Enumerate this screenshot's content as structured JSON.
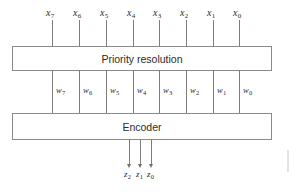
{
  "diagram": {
    "background_color": "#ffffff",
    "line_color": "#7d7d7d",
    "text_color": "#2b2b2b"
  },
  "blocks": [
    {
      "id": "priority",
      "label": "Priority resolution"
    },
    {
      "id": "encoder",
      "label": "Encoder"
    }
  ],
  "inputs": [
    {
      "base": "x",
      "index": "7"
    },
    {
      "base": "x",
      "index": "6"
    },
    {
      "base": "x",
      "index": "5"
    },
    {
      "base": "x",
      "index": "4"
    },
    {
      "base": "x",
      "index": "3"
    },
    {
      "base": "x",
      "index": "2"
    },
    {
      "base": "x",
      "index": "1"
    },
    {
      "base": "x",
      "index": "0"
    }
  ],
  "intermediate": [
    {
      "base": "w",
      "index": "7"
    },
    {
      "base": "w",
      "index": "6"
    },
    {
      "base": "w",
      "index": "5"
    },
    {
      "base": "w",
      "index": "4"
    },
    {
      "base": "w",
      "index": "3"
    },
    {
      "base": "w",
      "index": "2"
    },
    {
      "base": "w",
      "index": "1"
    },
    {
      "base": "w",
      "index": "0"
    }
  ],
  "outputs": [
    {
      "base": "z",
      "index": "2"
    },
    {
      "base": "z",
      "index": "1"
    },
    {
      "base": "z",
      "index": "0"
    }
  ]
}
